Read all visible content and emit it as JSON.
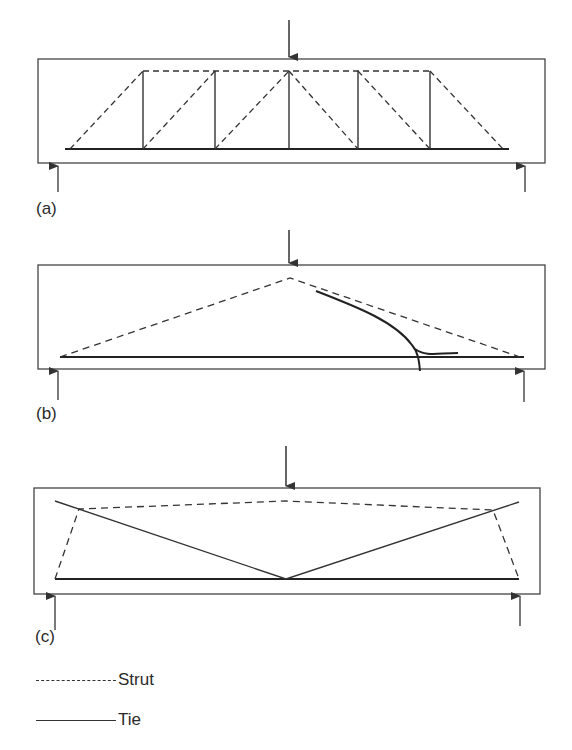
{
  "figure": {
    "panels": [
      {
        "id": "a",
        "label": "(a)",
        "description": "Truss model with vertical ties and inclined struts"
      },
      {
        "id": "b",
        "label": "(b)",
        "description": "Tied arch model with crack"
      },
      {
        "id": "c",
        "label": "(c)",
        "description": "Strut-and-tie model with inclined ties"
      }
    ],
    "legend": [
      {
        "style": "dashed",
        "label": "Strut"
      },
      {
        "style": "solid",
        "label": "Tie"
      }
    ],
    "colors": {
      "line": "#333333",
      "background": "#ffffff"
    }
  }
}
